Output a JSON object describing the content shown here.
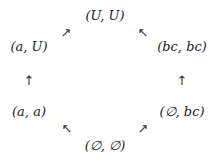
{
  "diagram": {
    "type": "lattice / Hasse diagram",
    "nodes": [
      {
        "id": "top",
        "label": "(U, U)",
        "x": 105,
        "y": 15
      },
      {
        "id": "upper-left",
        "label": "(a, U)",
        "x": 29,
        "y": 46
      },
      {
        "id": "upper-right",
        "label": "(bc, bc)",
        "x": 182,
        "y": 46
      },
      {
        "id": "lower-left",
        "label": "(a, a)",
        "x": 29,
        "y": 111
      },
      {
        "id": "lower-right",
        "label": "(∅, bc)",
        "x": 182,
        "y": 111
      },
      {
        "id": "bottom",
        "label": "(∅, ∅)",
        "x": 105,
        "y": 145
      }
    ],
    "arrows": [
      {
        "from": "upper-left",
        "to": "top",
        "glyph": "↗",
        "x": 66,
        "y": 32
      },
      {
        "from": "upper-right",
        "to": "top",
        "glyph": "↖",
        "x": 143,
        "y": 32
      },
      {
        "from": "lower-left",
        "to": "upper-left",
        "glyph": "↑",
        "x": 29,
        "y": 80
      },
      {
        "from": "lower-right",
        "to": "upper-right",
        "glyph": "↑",
        "x": 182,
        "y": 80
      },
      {
        "from": "bottom",
        "to": "lower-left",
        "glyph": "↖",
        "x": 67,
        "y": 128
      },
      {
        "from": "bottom",
        "to": "lower-right",
        "glyph": "↗",
        "x": 143,
        "y": 128
      }
    ]
  }
}
